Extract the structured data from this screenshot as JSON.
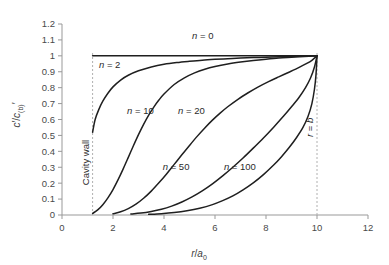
{
  "chart_data": {
    "type": "line",
    "title": "",
    "xlabel": "r/a0",
    "ylabel": "c'/c'(b)",
    "xlim": [
      0,
      12
    ],
    "ylim": [
      0,
      1.2
    ],
    "xticks": [
      "0",
      "2",
      "4",
      "6",
      "8",
      "10",
      "12"
    ],
    "xtick_values": [
      0,
      2,
      4,
      6,
      8,
      10,
      12
    ],
    "yticks": [
      "0",
      "0.1",
      "0.2",
      "0.3",
      "0.4",
      "0.5",
      "0.6",
      "0.7",
      "0.8",
      "0.9",
      "1",
      "1.1",
      "1.2"
    ],
    "ytick_values": [
      0,
      0.1,
      0.2,
      0.3,
      0.4,
      0.5,
      0.6,
      0.7,
      0.8,
      0.9,
      1.0,
      1.1,
      1.2
    ],
    "grid": false,
    "legend_position": "inline-labels",
    "cavity_wall_x": 1.2,
    "outer_boundary_x": 10,
    "annotations": [
      {
        "text": "Cavity wall",
        "x": 1.2,
        "y": 0.33,
        "rotation": -90
      },
      {
        "text": "r = b",
        "x": 10,
        "y": 0.55,
        "rotation": -90
      }
    ],
    "series": [
      {
        "name": "n = 0",
        "label": "n = 0",
        "n": 0,
        "label_x": 5.1,
        "label_y": 1.105,
        "points": [
          [
            1.2,
            1.0
          ],
          [
            2,
            1.0
          ],
          [
            3,
            1.0
          ],
          [
            4,
            1.0
          ],
          [
            5,
            1.0
          ],
          [
            6,
            1.0
          ],
          [
            7,
            1.0
          ],
          [
            8,
            1.0
          ],
          [
            9,
            1.0
          ],
          [
            10,
            1.0
          ]
        ]
      },
      {
        "name": "n = 2",
        "label": "n = 2",
        "n": 2,
        "label_x": 1.45,
        "label_y": 0.925,
        "points": [
          [
            1.2,
            0.52
          ],
          [
            1.3,
            0.6
          ],
          [
            1.45,
            0.665
          ],
          [
            1.6,
            0.715
          ],
          [
            1.8,
            0.765
          ],
          [
            2.0,
            0.805
          ],
          [
            2.3,
            0.848
          ],
          [
            2.6,
            0.878
          ],
          [
            3.0,
            0.906
          ],
          [
            3.5,
            0.93
          ],
          [
            4.0,
            0.947
          ],
          [
            4.5,
            0.958
          ],
          [
            5.0,
            0.966
          ],
          [
            5.5,
            0.973
          ],
          [
            6.0,
            0.978
          ],
          [
            6.5,
            0.982
          ],
          [
            7.0,
            0.986
          ],
          [
            7.5,
            0.989
          ],
          [
            8.0,
            0.991
          ],
          [
            8.5,
            0.994
          ],
          [
            9.0,
            0.996
          ],
          [
            9.5,
            0.998
          ],
          [
            10.0,
            1.0
          ]
        ]
      },
      {
        "name": "n = 10",
        "label": "n = 10",
        "n": 10,
        "label_x": 2.55,
        "label_y": 0.635,
        "points": [
          [
            1.2,
            0.01
          ],
          [
            1.4,
            0.032
          ],
          [
            1.6,
            0.065
          ],
          [
            1.8,
            0.108
          ],
          [
            2.0,
            0.16
          ],
          [
            2.2,
            0.222
          ],
          [
            2.4,
            0.29
          ],
          [
            2.6,
            0.362
          ],
          [
            2.8,
            0.435
          ],
          [
            3.0,
            0.505
          ],
          [
            3.2,
            0.57
          ],
          [
            3.4,
            0.628
          ],
          [
            3.6,
            0.678
          ],
          [
            3.8,
            0.722
          ],
          [
            4.0,
            0.76
          ],
          [
            4.4,
            0.82
          ],
          [
            4.8,
            0.862
          ],
          [
            5.2,
            0.893
          ],
          [
            5.6,
            0.916
          ],
          [
            6.0,
            0.933
          ],
          [
            6.5,
            0.949
          ],
          [
            7.0,
            0.961
          ],
          [
            7.5,
            0.971
          ],
          [
            8.0,
            0.979
          ],
          [
            8.5,
            0.986
          ],
          [
            9.0,
            0.991
          ],
          [
            9.5,
            0.996
          ],
          [
            10.0,
            1.0
          ]
        ]
      },
      {
        "name": "n = 20",
        "label": "n = 20",
        "n": 20,
        "label_x": 4.55,
        "label_y": 0.635,
        "points": [
          [
            2.0,
            0.008
          ],
          [
            2.3,
            0.02
          ],
          [
            2.6,
            0.04
          ],
          [
            2.9,
            0.068
          ],
          [
            3.2,
            0.105
          ],
          [
            3.5,
            0.15
          ],
          [
            3.8,
            0.202
          ],
          [
            4.1,
            0.258
          ],
          [
            4.4,
            0.318
          ],
          [
            4.7,
            0.378
          ],
          [
            5.0,
            0.437
          ],
          [
            5.3,
            0.494
          ],
          [
            5.6,
            0.547
          ],
          [
            5.9,
            0.596
          ],
          [
            6.2,
            0.64
          ],
          [
            6.5,
            0.68
          ],
          [
            6.9,
            0.727
          ],
          [
            7.3,
            0.768
          ],
          [
            7.7,
            0.805
          ],
          [
            8.1,
            0.838
          ],
          [
            8.5,
            0.868
          ],
          [
            8.9,
            0.897
          ],
          [
            9.3,
            0.927
          ],
          [
            9.6,
            0.952
          ],
          [
            9.8,
            0.972
          ],
          [
            10.0,
            1.0
          ]
        ]
      },
      {
        "name": "n = 50",
        "label": "n = 50",
        "n": 50,
        "label_x": 3.95,
        "label_y": 0.285,
        "points": [
          [
            2.7,
            0.006
          ],
          [
            3.1,
            0.012
          ],
          [
            3.5,
            0.022
          ],
          [
            3.9,
            0.036
          ],
          [
            4.3,
            0.056
          ],
          [
            4.7,
            0.082
          ],
          [
            5.1,
            0.114
          ],
          [
            5.5,
            0.152
          ],
          [
            5.9,
            0.196
          ],
          [
            6.3,
            0.246
          ],
          [
            6.7,
            0.3
          ],
          [
            7.1,
            0.358
          ],
          [
            7.5,
            0.42
          ],
          [
            7.9,
            0.484
          ],
          [
            8.3,
            0.552
          ],
          [
            8.7,
            0.623
          ],
          [
            9.0,
            0.68
          ],
          [
            9.3,
            0.74
          ],
          [
            9.55,
            0.8
          ],
          [
            9.75,
            0.862
          ],
          [
            9.9,
            0.93
          ],
          [
            10.0,
            1.0
          ]
        ]
      },
      {
        "name": "n = 100",
        "label": "n = 100",
        "n": 100,
        "label_x": 6.35,
        "label_y": 0.285,
        "points": [
          [
            3.4,
            0.004
          ],
          [
            3.9,
            0.008
          ],
          [
            4.4,
            0.015
          ],
          [
            4.9,
            0.026
          ],
          [
            5.4,
            0.042
          ],
          [
            5.9,
            0.065
          ],
          [
            6.3,
            0.09
          ],
          [
            6.7,
            0.12
          ],
          [
            7.1,
            0.158
          ],
          [
            7.5,
            0.202
          ],
          [
            7.9,
            0.254
          ],
          [
            8.3,
            0.314
          ],
          [
            8.6,
            0.365
          ],
          [
            8.9,
            0.422
          ],
          [
            9.2,
            0.487
          ],
          [
            9.45,
            0.55
          ],
          [
            9.65,
            0.62
          ],
          [
            9.8,
            0.7
          ],
          [
            9.9,
            0.79
          ],
          [
            9.96,
            0.88
          ],
          [
            10.0,
            1.0
          ]
        ]
      }
    ]
  },
  "style": {
    "axis_color": "#999999",
    "curve_color": "#1f1f1f",
    "dashed_color": "#b0b0b0",
    "text_color": "#3d3d3d",
    "background": "#ffffff"
  }
}
